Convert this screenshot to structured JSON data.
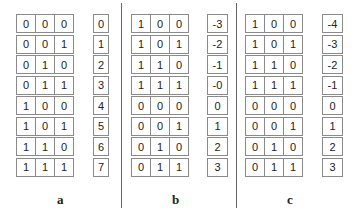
{
  "panels": [
    {
      "label": "a",
      "bits": [
        [
          "0",
          "0",
          "0"
        ],
        [
          "0",
          "0",
          "1"
        ],
        [
          "0",
          "1",
          "0"
        ],
        [
          "0",
          "1",
          "1"
        ],
        [
          "1",
          "0",
          "0"
        ],
        [
          "1",
          "0",
          "1"
        ],
        [
          "1",
          "1",
          "0"
        ],
        [
          "1",
          "1",
          "1"
        ]
      ],
      "values": [
        "0",
        "1",
        "2",
        "3",
        "4",
        "5",
        "6",
        "7"
      ]
    },
    {
      "label": "b",
      "bits": [
        [
          "1",
          "0",
          "0"
        ],
        [
          "1",
          "0",
          "1"
        ],
        [
          "1",
          "1",
          "0"
        ],
        [
          "1",
          "1",
          "1"
        ],
        [
          "0",
          "0",
          "0"
        ],
        [
          "0",
          "0",
          "1"
        ],
        [
          "0",
          "1",
          "0"
        ],
        [
          "0",
          "1",
          "1"
        ]
      ],
      "values": [
        "-3",
        "-2",
        "-1",
        "-0",
        "0",
        "1",
        "2",
        "3"
      ]
    },
    {
      "label": "c",
      "bits": [
        [
          "1",
          "0",
          "0"
        ],
        [
          "1",
          "0",
          "1"
        ],
        [
          "1",
          "1",
          "0"
        ],
        [
          "1",
          "1",
          "1"
        ],
        [
          "0",
          "0",
          "0"
        ],
        [
          "0",
          "0",
          "1"
        ],
        [
          "0",
          "1",
          "0"
        ],
        [
          "0",
          "1",
          "1"
        ]
      ],
      "values": [
        "-4",
        "-3",
        "-2",
        "-1",
        "0",
        "1",
        "2",
        "3"
      ]
    }
  ]
}
